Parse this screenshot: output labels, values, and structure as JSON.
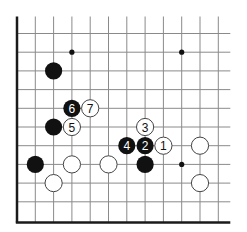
{
  "diagram": {
    "type": "go-board-fragment",
    "grid": {
      "columns": 12,
      "rows": 11,
      "x0": 17,
      "dx": 18.3,
      "y0": 33.5,
      "dy": 18.7,
      "edges": [
        "left",
        "bottom"
      ]
    },
    "colors": {
      "black": "#111111",
      "white": "#ffffff",
      "line": "#8a8a8a",
      "edge": "#1a1a1a"
    },
    "star_points": [
      {
        "col": 3,
        "row": 1
      },
      {
        "col": 9,
        "row": 1
      },
      {
        "col": 9,
        "row": 7
      }
    ],
    "stones": [
      {
        "color": "black",
        "col": 2,
        "row": 2,
        "label": ""
      },
      {
        "color": "black",
        "col": 3,
        "row": 4,
        "label": "6"
      },
      {
        "color": "white",
        "col": 4,
        "row": 4,
        "label": "7"
      },
      {
        "color": "black",
        "col": 2,
        "row": 5,
        "label": ""
      },
      {
        "color": "white",
        "col": 3,
        "row": 5,
        "label": "5"
      },
      {
        "color": "white",
        "col": 7,
        "row": 5,
        "label": "3"
      },
      {
        "color": "black",
        "col": 6,
        "row": 6,
        "label": "4"
      },
      {
        "color": "black",
        "col": 7,
        "row": 6,
        "label": "2"
      },
      {
        "color": "white",
        "col": 8,
        "row": 6,
        "label": "1"
      },
      {
        "color": "white",
        "col": 10,
        "row": 6,
        "label": ""
      },
      {
        "color": "black",
        "col": 1,
        "row": 7,
        "label": ""
      },
      {
        "color": "white",
        "col": 3,
        "row": 7,
        "label": ""
      },
      {
        "color": "white",
        "col": 5,
        "row": 7,
        "label": ""
      },
      {
        "color": "black",
        "col": 7,
        "row": 7,
        "label": ""
      },
      {
        "color": "white",
        "col": 2,
        "row": 8,
        "label": ""
      },
      {
        "color": "white",
        "col": 10,
        "row": 8,
        "label": ""
      }
    ]
  }
}
